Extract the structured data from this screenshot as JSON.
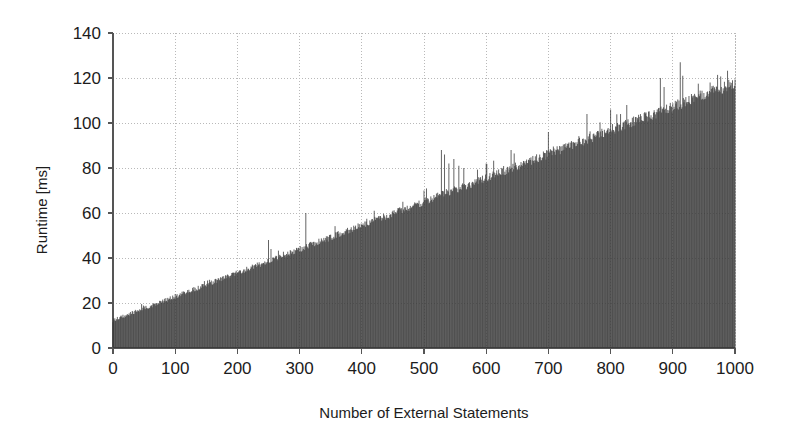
{
  "chart_data": {
    "type": "bar",
    "title": "",
    "subtitle": "",
    "xlabel": "Number of External Statements",
    "ylabel": "Runtime [ms]",
    "xlim": [
      0,
      1000
    ],
    "ylim": [
      0,
      140
    ],
    "xticks": [
      0,
      100,
      200,
      300,
      400,
      500,
      600,
      700,
      800,
      900,
      1000
    ],
    "yticks": [
      0,
      20,
      40,
      60,
      80,
      100,
      120,
      140
    ],
    "grid": true,
    "legend": null,
    "legend_position": "none",
    "bar_color": "#3a3a3a",
    "background_color": "#ffffff",
    "grid_color": "#b9b9b9",
    "axis_color": "#555555",
    "baseline_fit": {
      "intercept": 12,
      "slope_per_statement": 0.105,
      "noise_amplitude": 3.5
    },
    "outlier_spikes": [
      {
        "x": 250,
        "y": 48
      },
      {
        "x": 254,
        "y": 44
      },
      {
        "x": 262,
        "y": 41
      },
      {
        "x": 310,
        "y": 60
      },
      {
        "x": 356,
        "y": 44
      },
      {
        "x": 420,
        "y": 61
      },
      {
        "x": 426,
        "y": 58
      },
      {
        "x": 466,
        "y": 65
      },
      {
        "x": 500,
        "y": 70
      },
      {
        "x": 528,
        "y": 88
      },
      {
        "x": 533,
        "y": 86
      },
      {
        "x": 540,
        "y": 82
      },
      {
        "x": 548,
        "y": 84
      },
      {
        "x": 556,
        "y": 81
      },
      {
        "x": 564,
        "y": 80
      },
      {
        "x": 600,
        "y": 82
      },
      {
        "x": 640,
        "y": 88
      },
      {
        "x": 700,
        "y": 96
      },
      {
        "x": 762,
        "y": 104
      },
      {
        "x": 800,
        "y": 106
      },
      {
        "x": 826,
        "y": 108
      },
      {
        "x": 880,
        "y": 120
      },
      {
        "x": 886,
        "y": 116
      },
      {
        "x": 912,
        "y": 127
      },
      {
        "x": 916,
        "y": 121
      },
      {
        "x": 960,
        "y": 118
      },
      {
        "x": 996,
        "y": 119
      }
    ],
    "categories": [
      0,
      50,
      100,
      150,
      200,
      250,
      300,
      350,
      400,
      450,
      500,
      550,
      600,
      650,
      700,
      750,
      800,
      850,
      900,
      950,
      1000
    ],
    "values": [
      12,
      17,
      22,
      28,
      33,
      39,
      44,
      49,
      55,
      60,
      65,
      71,
      76,
      81,
      86,
      92,
      97,
      102,
      107,
      113,
      117
    ]
  },
  "axis": {
    "ylabel": "Runtime [ms]",
    "xlabel": "Number of External Statements",
    "ytick_labels": [
      "0",
      "20",
      "40",
      "60",
      "80",
      "100",
      "120",
      "140"
    ],
    "xtick_labels": [
      "0",
      "100",
      "200",
      "300",
      "400",
      "500",
      "600",
      "700",
      "800",
      "900",
      "1000"
    ]
  }
}
